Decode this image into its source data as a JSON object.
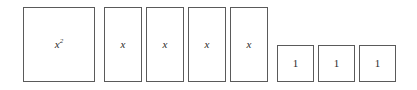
{
  "diagram": {
    "background_color": "#ffffff",
    "border_color": "#5a5a5a",
    "label_color": "#2b2b2b",
    "tiles": [
      {
        "id": "x-squared-tile",
        "kind": "x-squared",
        "label_base": "x",
        "label_exponent": "2",
        "count": 1
      },
      {
        "id": "x-tile-1",
        "kind": "x",
        "label": "x"
      },
      {
        "id": "x-tile-2",
        "kind": "x",
        "label": "x"
      },
      {
        "id": "x-tile-3",
        "kind": "x",
        "label": "x"
      },
      {
        "id": "x-tile-4",
        "kind": "x",
        "label": "x"
      },
      {
        "id": "unit-tile-1",
        "kind": "unit",
        "label": "1"
      },
      {
        "id": "unit-tile-2",
        "kind": "unit",
        "label": "1"
      },
      {
        "id": "unit-tile-3",
        "kind": "unit",
        "label": "1"
      }
    ]
  }
}
